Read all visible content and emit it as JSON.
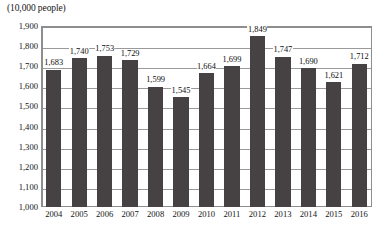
{
  "chart_data": {
    "type": "bar",
    "title": "(10,000 people)",
    "xlabel": "",
    "ylabel": "(10,000 people)",
    "ylim": [
      1000,
      1900
    ],
    "ytick_step": 100,
    "grid": true,
    "legend": "none",
    "bar_color": "#464243",
    "frame_color": "#8e8e8e",
    "gridline_color": "#9a9a9a",
    "categories": [
      "2004",
      "2005",
      "2006",
      "2007",
      "2008",
      "2009",
      "2010",
      "2011",
      "2012",
      "2013",
      "2014",
      "2015",
      "2016"
    ],
    "values": [
      1683,
      1740,
      1753,
      1729,
      1599,
      1545,
      1664,
      1699,
      1849,
      1747,
      1690,
      1621,
      1712
    ],
    "value_labels": [
      "1,683",
      "1,740",
      "1,753",
      "1,729",
      "1,599",
      "1,545",
      "1,664",
      "1,699",
      "1,849",
      "1,747",
      "1,690",
      "1,621",
      "1,712"
    ],
    "ytick_labels": [
      "1,900",
      "1,800",
      "1,700",
      "1,600",
      "1,500",
      "1,400",
      "1,300",
      "1,200",
      "1,100",
      "1,000"
    ],
    "ytick_values": [
      1900,
      1800,
      1700,
      1600,
      1500,
      1400,
      1300,
      1200,
      1100,
      1000
    ]
  }
}
